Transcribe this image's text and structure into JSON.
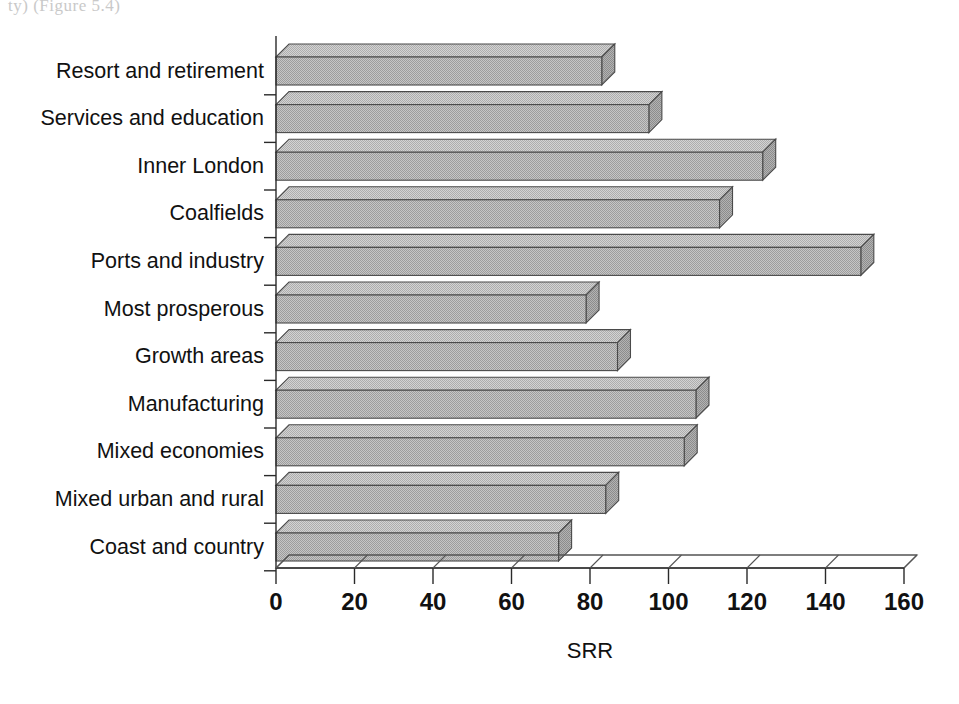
{
  "page": {
    "bleed_text": "ty) (Figure 5.4)",
    "background_color": "#ffffff"
  },
  "chart_data": {
    "type": "bar",
    "orientation": "horizontal",
    "title": "",
    "xlabel": "SRR",
    "ylabel": "",
    "xlim": [
      0,
      160
    ],
    "xticks": [
      0,
      20,
      40,
      60,
      80,
      100,
      120,
      140,
      160
    ],
    "xtick_labels": [
      "0",
      "20",
      "40",
      "60",
      "80",
      "100",
      "120",
      "140",
      "160"
    ],
    "grid": false,
    "legend": false,
    "style": "3d-bars",
    "bar_fill_color": "#b9b9b9",
    "bar_edge_color": "#4a4a4a",
    "categories": [
      "Resort and retirement",
      "Services and education",
      "Inner London",
      "Coalfields",
      "Ports and industry",
      "Most prosperous",
      "Growth areas",
      "Manufacturing",
      "Mixed economies",
      "Mixed urban and rural",
      "Coast and country"
    ],
    "values": [
      83,
      95,
      124,
      113,
      149,
      79,
      87,
      107,
      104,
      84,
      72
    ]
  }
}
